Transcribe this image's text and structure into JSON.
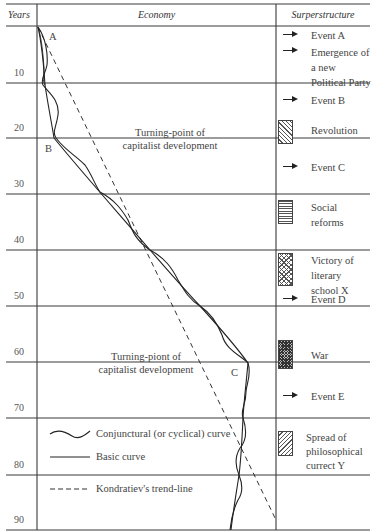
{
  "header": {
    "years": "Years",
    "economy": "Economy",
    "superstructure": "Surperstructure"
  },
  "year_ticks": [
    "10",
    "20",
    "30",
    "40",
    "50",
    "60",
    "70",
    "80",
    "90"
  ],
  "point_labels": {
    "a": "A",
    "b": "B",
    "c": "C"
  },
  "turning_points": [
    {
      "line1": "Turning-point of",
      "line2": "capitalist development"
    },
    {
      "line1": "Turning-piont of",
      "line2": "capitalist development"
    }
  ],
  "legend": {
    "conjunctural": "Conjunctural (or cyclical) curve",
    "basic": "Basic curve",
    "trend": "Kondratiev's trend-line"
  },
  "superstructure": {
    "event_a": "Event A",
    "party": [
      "Emergence of",
      "a new",
      "Political Party"
    ],
    "event_b": "Event B",
    "revolution": "Revolution",
    "event_c": "Event C",
    "social_reforms": [
      "Social",
      "reforms"
    ],
    "victory": [
      "Victory of",
      "literary",
      "school X"
    ],
    "event_d": "Event D",
    "war": "War",
    "event_e": "Event E",
    "spread": [
      "Spread of",
      "philosophical",
      "currect Y"
    ]
  },
  "colors": {
    "line": "#333333",
    "text": "#444444",
    "background": "#ffffff"
  }
}
